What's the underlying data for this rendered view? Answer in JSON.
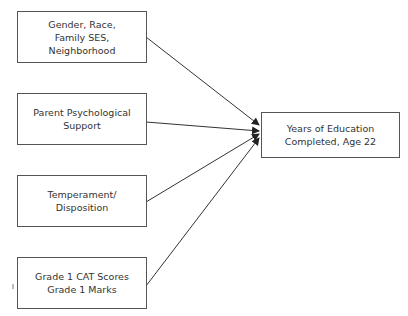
{
  "diagram": {
    "type": "path-diagram",
    "predictors": [
      {
        "id": "demographics",
        "label": "Gender, Race,\nFamily SES,\nNeighborhood"
      },
      {
        "id": "parent-support",
        "label": "Parent Psychological\nSupport"
      },
      {
        "id": "temperament",
        "label": "Temperament/\nDisposition"
      },
      {
        "id": "grade1",
        "label": "Grade 1 CAT Scores\nGrade 1 Marks"
      }
    ],
    "outcome": {
      "id": "education",
      "label": "Years of Education\nCompleted, Age 22"
    },
    "edges": [
      {
        "from": "demographics",
        "to": "education"
      },
      {
        "from": "parent-support",
        "to": "education"
      },
      {
        "from": "temperament",
        "to": "education"
      },
      {
        "from": "grade1",
        "to": "education"
      }
    ],
    "colors": {
      "line": "#333333",
      "border": "#555555",
      "text": "#333333",
      "background": "#ffffff"
    }
  }
}
